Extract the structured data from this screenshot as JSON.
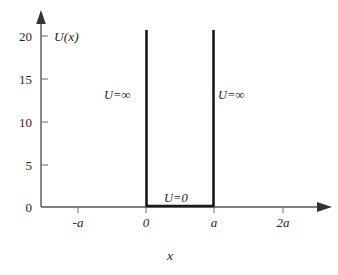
{
  "figure": {
    "title": "",
    "background_color": "#ffffff",
    "line_color": "#1a1a1a",
    "axis_color": "#555555",
    "text_color": "#262626"
  },
  "axes": {
    "y_axis_name": "U(x)",
    "x_axis_name": "x",
    "y_ticks": [
      "20",
      "15",
      "10",
      "5",
      "0"
    ],
    "x_ticks": [
      "-a",
      "0",
      "a",
      "2a"
    ]
  },
  "annotations": {
    "left_wall": "U=∞",
    "right_wall": "U=∞",
    "well_floor": "U=0"
  },
  "chart_data": {
    "type": "line",
    "title": "",
    "xlabel": "x",
    "ylabel": "U(x)",
    "xlim": [
      -1.55,
      2.6
    ],
    "ylim": [
      0,
      21.5
    ],
    "grid": false,
    "legend": null,
    "x_tick_values": [
      -1,
      0,
      1,
      2
    ],
    "x_tick_labels": [
      "-a",
      "0",
      "a",
      "2a"
    ],
    "y_tick_values": [
      0,
      5,
      10,
      15,
      20
    ],
    "y_tick_labels": [
      "0",
      "5",
      "10",
      "15",
      "20"
    ],
    "series": [
      {
        "name": "U(x)",
        "x": [
          0,
          0,
          1,
          1
        ],
        "y": [
          20,
          0,
          0,
          20
        ],
        "comment": "left wall rises to 20, floor at U=0 from x=0 to x=a, right wall rises to 20"
      }
    ],
    "annotations": [
      {
        "text": "U=∞",
        "x": -0.28,
        "y": 12.5
      },
      {
        "text": "U=∞",
        "x": 1.28,
        "y": 12.5
      },
      {
        "text": "U=0",
        "x": 0.52,
        "y": 1.1
      }
    ]
  }
}
